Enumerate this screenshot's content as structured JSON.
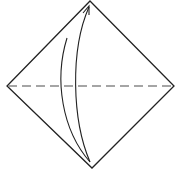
{
  "diagram": {
    "type": "origami-fold-instruction",
    "fold_line": {
      "style": "valley-fold (dashed)",
      "orientation": "horizontal",
      "description": "diagonal crease connecting left and right corners"
    },
    "arrow": {
      "description": "fold bottom corner up to top corner",
      "from": "bottom-corner",
      "to": "top-corner"
    },
    "colors": {
      "stroke": "#222222",
      "dash": "#888888",
      "background": "#ffffff"
    }
  }
}
